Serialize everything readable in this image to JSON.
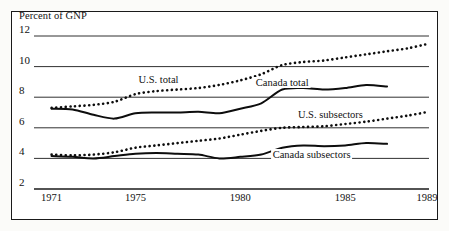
{
  "chart_data": {
    "type": "line",
    "title": "",
    "subtitle": "",
    "ylabel": "Percent of GNP",
    "xlabel": "",
    "ylim": [
      2,
      12
    ],
    "xlim": [
      1970.4,
      1989
    ],
    "grid": true,
    "gridlines": "horizontal",
    "legend_position": "inline-annotations",
    "yticks": [
      12,
      10,
      8,
      6,
      4,
      2
    ],
    "ytick_labels": [
      "12",
      "10",
      "8",
      "6",
      "4",
      "2"
    ],
    "xticks": [
      1971,
      1975,
      1980,
      1985,
      1989
    ],
    "xtick_labels": [
      "1971",
      "1975",
      "1980",
      "1985",
      "1989"
    ],
    "series": [
      {
        "name": "U.S. total",
        "style": "dotted",
        "label": "U.S. total",
        "label_x": 1976.1,
        "label_y": 9.15,
        "x": [
          1971,
          1972,
          1973,
          1974,
          1975,
          1976,
          1977,
          1978,
          1979,
          1980,
          1981,
          1982,
          1983,
          1984,
          1985,
          1986,
          1987,
          1988,
          1989
        ],
        "values": [
          7.3,
          7.4,
          7.5,
          7.7,
          8.2,
          8.4,
          8.5,
          8.6,
          8.8,
          9.1,
          9.5,
          10.1,
          10.3,
          10.4,
          10.6,
          10.8,
          11.0,
          11.2,
          11.5
        ]
      },
      {
        "name": "Canada total",
        "style": "solid",
        "label": "Canada total",
        "label_x": 1982.0,
        "label_y": 8.95,
        "x": [
          1971,
          1972,
          1973,
          1974,
          1975,
          1976,
          1977,
          1978,
          1979,
          1980,
          1981,
          1982,
          1983,
          1984,
          1985,
          1986,
          1987
        ],
        "values": [
          7.25,
          7.2,
          6.85,
          6.6,
          6.95,
          7.0,
          7.0,
          7.05,
          6.95,
          7.25,
          7.6,
          8.5,
          8.6,
          8.5,
          8.6,
          8.8,
          8.7
        ]
      },
      {
        "name": "U.S. subsectors",
        "style": "dotted",
        "label": "U.S. subsectors",
        "label_x": 1984.3,
        "label_y": 6.85,
        "x": [
          1971,
          1972,
          1973,
          1974,
          1975,
          1976,
          1977,
          1978,
          1979,
          1980,
          1981,
          1982,
          1983,
          1984,
          1985,
          1986,
          1987,
          1988,
          1989
        ],
        "values": [
          4.25,
          4.2,
          4.25,
          4.4,
          4.7,
          4.85,
          5.0,
          5.15,
          5.3,
          5.55,
          5.8,
          6.0,
          6.05,
          6.1,
          6.25,
          6.4,
          6.6,
          6.8,
          7.05
        ]
      },
      {
        "name": "Canada subsectors",
        "style": "solid",
        "label": "Canada subsectors",
        "label_x": 1983.4,
        "label_y": 4.25,
        "x": [
          1971,
          1972,
          1973,
          1974,
          1975,
          1976,
          1977,
          1978,
          1979,
          1980,
          1981,
          1982,
          1983,
          1984,
          1985,
          1986,
          1987
        ],
        "values": [
          4.15,
          4.1,
          4.0,
          4.15,
          4.3,
          4.35,
          4.3,
          4.25,
          4.0,
          4.1,
          4.25,
          4.7,
          4.85,
          4.8,
          4.85,
          5.0,
          4.95
        ]
      }
    ]
  }
}
